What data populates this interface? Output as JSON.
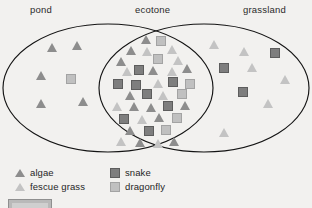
{
  "figure": {
    "type": "venn-diagram",
    "background_color": "#f2f1ef",
    "outline_color": "#141414",
    "regions": [
      {
        "id": "pond",
        "label": "pond"
      },
      {
        "id": "ecotone",
        "label": "ecotone"
      },
      {
        "id": "grassland",
        "label": "grassland"
      }
    ]
  },
  "legend": {
    "items": [
      {
        "id": "algae",
        "label": "algae",
        "shape": "triangle-icon",
        "tone": "dark",
        "color": "#8d8d8d"
      },
      {
        "id": "snake",
        "label": "snake",
        "shape": "square-icon",
        "tone": "dark",
        "color": "#7e7e7e"
      },
      {
        "id": "fescue-grass",
        "label": "fescue grass",
        "shape": "triangle-icon",
        "tone": "light",
        "color": "#c3c3c3"
      },
      {
        "id": "dragonfly",
        "label": "dragonfly",
        "shape": "square-icon",
        "tone": "light",
        "color": "#c0c0c0"
      }
    ]
  },
  "chart_data": {
    "type": "scatter",
    "title": "",
    "xlabel": "",
    "ylabel": "",
    "regions": [
      {
        "name": "pond",
        "counts": {
          "algae": 5,
          "fescue grass": 0,
          "snake": 0,
          "dragonfly": 1
        }
      },
      {
        "name": "ecotone",
        "counts": {
          "algae": 13,
          "fescue grass": 12,
          "snake": 11,
          "dragonfly": 10
        }
      },
      {
        "name": "grassland",
        "counts": {
          "algae": 0,
          "fescue grass": 6,
          "snake": 3,
          "dragonfly": 0
        }
      }
    ],
    "symbols": [
      {
        "region": "pond",
        "species": "algae",
        "shape": "triangle",
        "tone": "dark",
        "x": 52,
        "y": 34
      },
      {
        "region": "pond",
        "species": "algae",
        "shape": "triangle",
        "tone": "dark",
        "x": 77,
        "y": 32
      },
      {
        "region": "pond",
        "species": "algae",
        "shape": "triangle",
        "tone": "dark",
        "x": 41,
        "y": 62
      },
      {
        "region": "pond",
        "species": "algae",
        "shape": "triangle",
        "tone": "dark",
        "x": 41,
        "y": 90
      },
      {
        "region": "pond",
        "species": "algae",
        "shape": "triangle",
        "tone": "dark",
        "x": 83,
        "y": 88
      },
      {
        "region": "pond",
        "species": "dragonfly",
        "shape": "square",
        "tone": "light",
        "x": 71,
        "y": 65
      },
      {
        "region": "ecotone",
        "species": "algae",
        "shape": "triangle",
        "tone": "dark",
        "x": 146,
        "y": 26
      },
      {
        "region": "ecotone",
        "species": "dragonfly",
        "shape": "square",
        "tone": "light",
        "x": 161,
        "y": 27
      },
      {
        "region": "ecotone",
        "species": "algae",
        "shape": "triangle",
        "tone": "dark",
        "x": 131,
        "y": 37
      },
      {
        "region": "ecotone",
        "species": "fescue grass",
        "shape": "triangle",
        "tone": "light",
        "x": 147,
        "y": 38
      },
      {
        "region": "ecotone",
        "species": "fescue grass",
        "shape": "triangle",
        "tone": "light",
        "x": 172,
        "y": 36
      },
      {
        "region": "ecotone",
        "species": "algae",
        "shape": "triangle",
        "tone": "dark",
        "x": 121,
        "y": 48
      },
      {
        "region": "ecotone",
        "species": "dragonfly",
        "shape": "square",
        "tone": "light",
        "x": 158,
        "y": 45
      },
      {
        "region": "ecotone",
        "species": "fescue grass",
        "shape": "triangle",
        "tone": "light",
        "x": 178,
        "y": 47
      },
      {
        "region": "ecotone",
        "species": "fescue grass",
        "shape": "triangle",
        "tone": "light",
        "x": 127,
        "y": 58
      },
      {
        "region": "ecotone",
        "species": "snake",
        "shape": "square",
        "tone": "dark",
        "x": 139,
        "y": 56
      },
      {
        "region": "ecotone",
        "species": "algae",
        "shape": "triangle",
        "tone": "dark",
        "x": 153,
        "y": 57
      },
      {
        "region": "ecotone",
        "species": "fescue grass",
        "shape": "triangle",
        "tone": "light",
        "x": 172,
        "y": 58
      },
      {
        "region": "ecotone",
        "species": "algae",
        "shape": "triangle",
        "tone": "dark",
        "x": 187,
        "y": 55
      },
      {
        "region": "ecotone",
        "species": "snake",
        "shape": "square",
        "tone": "dark",
        "x": 118,
        "y": 70
      },
      {
        "region": "ecotone",
        "species": "snake",
        "shape": "square",
        "tone": "dark",
        "x": 136,
        "y": 71
      },
      {
        "region": "ecotone",
        "species": "fescue grass",
        "shape": "triangle",
        "tone": "light",
        "x": 158,
        "y": 70
      },
      {
        "region": "ecotone",
        "species": "snake",
        "shape": "square",
        "tone": "dark",
        "x": 173,
        "y": 68
      },
      {
        "region": "ecotone",
        "species": "dragonfly",
        "shape": "square",
        "tone": "light",
        "x": 190,
        "y": 70
      },
      {
        "region": "ecotone",
        "species": "algae",
        "shape": "triangle",
        "tone": "dark",
        "x": 130,
        "y": 82
      },
      {
        "region": "ecotone",
        "species": "snake",
        "shape": "square",
        "tone": "dark",
        "x": 147,
        "y": 80
      },
      {
        "region": "ecotone",
        "species": "fescue grass",
        "shape": "triangle",
        "tone": "light",
        "x": 163,
        "y": 82
      },
      {
        "region": "ecotone",
        "species": "dragonfly",
        "shape": "square",
        "tone": "light",
        "x": 182,
        "y": 80
      },
      {
        "region": "ecotone",
        "species": "fescue grass",
        "shape": "triangle",
        "tone": "light",
        "x": 117,
        "y": 93
      },
      {
        "region": "ecotone",
        "species": "algae",
        "shape": "triangle",
        "tone": "dark",
        "x": 134,
        "y": 93
      },
      {
        "region": "ecotone",
        "species": "algae",
        "shape": "triangle",
        "tone": "dark",
        "x": 151,
        "y": 94
      },
      {
        "region": "ecotone",
        "species": "snake",
        "shape": "square",
        "tone": "dark",
        "x": 168,
        "y": 92
      },
      {
        "region": "ecotone",
        "species": "algae",
        "shape": "triangle",
        "tone": "dark",
        "x": 185,
        "y": 92
      },
      {
        "region": "ecotone",
        "species": "snake",
        "shape": "square",
        "tone": "dark",
        "x": 124,
        "y": 105
      },
      {
        "region": "ecotone",
        "species": "fescue grass",
        "shape": "triangle",
        "tone": "light",
        "x": 142,
        "y": 106
      },
      {
        "region": "ecotone",
        "species": "algae",
        "shape": "triangle",
        "tone": "dark",
        "x": 159,
        "y": 104
      },
      {
        "region": "ecotone",
        "species": "dragonfly",
        "shape": "square",
        "tone": "light",
        "x": 177,
        "y": 104
      },
      {
        "region": "ecotone",
        "species": "algae",
        "shape": "triangle",
        "tone": "dark",
        "x": 130,
        "y": 117
      },
      {
        "region": "ecotone",
        "species": "snake",
        "shape": "square",
        "tone": "dark",
        "x": 149,
        "y": 117
      },
      {
        "region": "ecotone",
        "species": "dragonfly",
        "shape": "square",
        "tone": "light",
        "x": 166,
        "y": 116
      },
      {
        "region": "ecotone",
        "species": "fescue grass",
        "shape": "triangle",
        "tone": "light",
        "x": 121,
        "y": 128
      },
      {
        "region": "ecotone",
        "species": "algae",
        "shape": "triangle",
        "tone": "dark",
        "x": 140,
        "y": 129
      },
      {
        "region": "ecotone",
        "species": "fescue grass",
        "shape": "triangle",
        "tone": "light",
        "x": 158,
        "y": 130
      },
      {
        "region": "ecotone",
        "species": "algae",
        "shape": "triangle",
        "tone": "dark",
        "x": 174,
        "y": 128
      },
      {
        "region": "grassland",
        "species": "fescue grass",
        "shape": "triangle",
        "tone": "light",
        "x": 214,
        "y": 31
      },
      {
        "region": "grassland",
        "species": "fescue grass",
        "shape": "triangle",
        "tone": "light",
        "x": 244,
        "y": 38
      },
      {
        "region": "grassland",
        "species": "snake",
        "shape": "square",
        "tone": "dark",
        "x": 275,
        "y": 39
      },
      {
        "region": "grassland",
        "species": "snake",
        "shape": "square",
        "tone": "dark",
        "x": 224,
        "y": 54
      },
      {
        "region": "grassland",
        "species": "fescue grass",
        "shape": "triangle",
        "tone": "light",
        "x": 252,
        "y": 54
      },
      {
        "region": "grassland",
        "species": "fescue grass",
        "shape": "triangle",
        "tone": "light",
        "x": 285,
        "y": 66
      },
      {
        "region": "grassland",
        "species": "snake",
        "shape": "square",
        "tone": "dark",
        "x": 243,
        "y": 78
      },
      {
        "region": "grassland",
        "species": "fescue grass",
        "shape": "triangle",
        "tone": "light",
        "x": 268,
        "y": 90
      },
      {
        "region": "grassland",
        "species": "fescue grass",
        "shape": "triangle",
        "tone": "light",
        "x": 224,
        "y": 119
      }
    ]
  }
}
